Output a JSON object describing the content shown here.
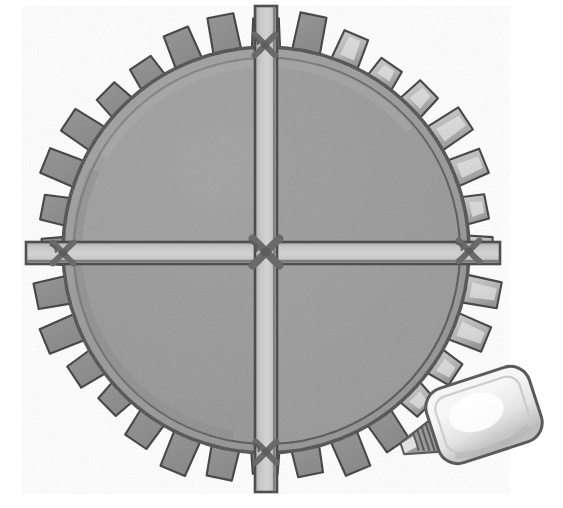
{
  "illustration": {
    "title": "Toothed wheel with cross braces and a squeeze bottle",
    "style": "pencil-and-wash grayscale drawing",
    "background_color": "#ffffff"
  },
  "canvas": {
    "width": 563,
    "height": 508
  },
  "palette": {
    "background": "#ffffff",
    "disc_fill": "#9a9a9a",
    "disc_fill_dark": "#8e8e8e",
    "disc_fill_light": "#a6a6a6",
    "tooth_fill": "#929292",
    "tooth_fill_highlight": "#cfcfcf",
    "tooth_fill_shadow": "#858585",
    "rim_line": "#4a4a4a",
    "outline": "#3e3e3e",
    "bar_fill": "#c6c6c6",
    "bar_fill_shadow": "#a9a9a9",
    "bar_edge": "#4e4e4e",
    "knot_fill": "#6a6a6a",
    "bottle_fill": "#e4e4e4",
    "bottle_highlight": "#f7f7f7",
    "bottle_shadow": "#bdbdbd",
    "bottle_outline": "#5a5a5a",
    "nozzle_fill": "#9b9b9b"
  },
  "wheel": {
    "name": "toothed-wheel",
    "center_x": 266,
    "center_y": 250,
    "rim_radius": 203,
    "inner_rim_radius": 193,
    "tooth_outer_radius": 232,
    "tooth_count": 32,
    "tooth_angular_width_deg": 6.6,
    "tooth_start_angle_deg": -90,
    "highlighted_tooth_range_deg": [
      -75,
      55
    ],
    "rim_line_width": 3.5
  },
  "braces": {
    "name": "cross-braces",
    "count": 2,
    "bar_half_width": 11,
    "vertical": {
      "label": "vertical-brace",
      "x": 266,
      "y_top": 6,
      "y_bottom": 492,
      "orientation": "vertical"
    },
    "horizontal": {
      "label": "horizontal-brace",
      "y": 253,
      "x_left": 26,
      "x_right": 500,
      "orientation": "horizontal"
    }
  },
  "lashings": [
    {
      "label": "center-lashing",
      "x": 266,
      "y": 252,
      "size": 26
    },
    {
      "label": "top-lashing",
      "x": 265,
      "y": 45,
      "size": 20
    },
    {
      "label": "bottom-lashing",
      "x": 266,
      "y": 452,
      "size": 20
    },
    {
      "label": "left-lashing",
      "x": 63,
      "y": 253,
      "size": 20
    },
    {
      "label": "right-lashing",
      "x": 469,
      "y": 251,
      "size": 20
    }
  ],
  "bottle": {
    "name": "squeeze-bottle",
    "body": {
      "x": 430,
      "y": 376,
      "width": 108,
      "height": 78,
      "corner_radius": 20,
      "rotation_deg": -18
    },
    "nozzle": {
      "tip_x": 398,
      "tip_y": 450,
      "collar_rings": 5,
      "rotation_deg": -18
    },
    "highlight_label": "bottle-gloss-highlight"
  },
  "quadrants": [
    {
      "label": "upper-left-quadrant",
      "shade": "#9d9d9d"
    },
    {
      "label": "upper-right-quadrant",
      "shade": "#979797"
    },
    {
      "label": "lower-left-quadrant",
      "shade": "#969696"
    },
    {
      "label": "lower-right-quadrant",
      "shade": "#9b9b9b"
    }
  ]
}
